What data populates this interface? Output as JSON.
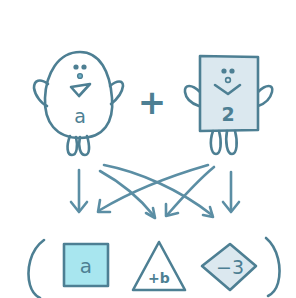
{
  "colors": {
    "ink": "#4d7f93",
    "arrow": "#5b8ea4",
    "square_character_fill": "#dbe8ef",
    "cyan_box_fill": "#a8e6ef",
    "diamond_fill": "#dbe8ef",
    "background": "#ffffff"
  },
  "top_row": {
    "left_character": {
      "shape": "egg",
      "label": "a"
    },
    "operator": "+",
    "right_character": {
      "shape": "rectangle",
      "label": "2"
    }
  },
  "arrows": {
    "count": 6,
    "description": "Each top character points to each bottom shape"
  },
  "bottom_row": {
    "open_paren": "(",
    "terms": [
      {
        "shape": "square",
        "label": "a"
      },
      {
        "shape": "triangle",
        "label": "+b"
      },
      {
        "shape": "diamond",
        "label": "−3"
      }
    ],
    "close_paren": ")"
  }
}
